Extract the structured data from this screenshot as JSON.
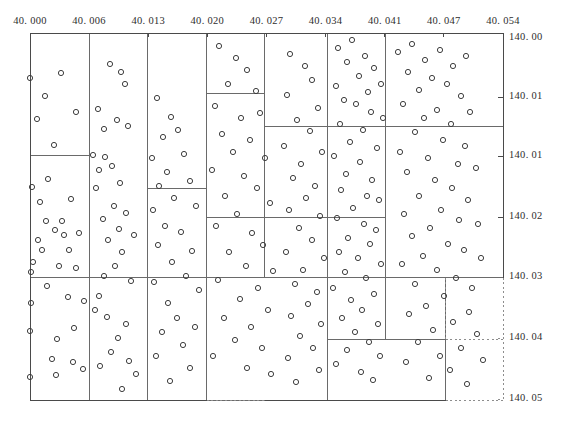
{
  "chart_data": {
    "type": "scatter",
    "title": "",
    "subtitle": "",
    "xlabel": "",
    "ylabel": "",
    "grid": false,
    "legend_position": "none",
    "xlim": [
      40.0,
      40.054
    ],
    "ylim": [
      140.0,
      140.05
    ],
    "y_axis_side": "right",
    "y_axis_direction": "inverted",
    "x_tick_labels": [
      "40. 000",
      "40. 006",
      "40. 013",
      "40. 020",
      "40. 027",
      "40. 034",
      "40. 041",
      "40. 047",
      "40. 054"
    ],
    "x_tick_values": [
      40.0,
      40.006,
      40.013,
      40.02,
      40.027,
      40.034,
      40.041,
      40.047,
      40.054
    ],
    "y_tick_labels": [
      "140. 00",
      "140. 01",
      "140. 01",
      "140. 02",
      "140. 03",
      "140. 04",
      "140. 05"
    ],
    "y_tick_values": [
      140.0,
      140.01,
      140.015,
      140.02,
      140.03,
      140.04,
      140.05
    ],
    "point_marker": "open-circle",
    "point_radius_px": 2.6,
    "colors": {
      "point_stroke": "#3d3d3d",
      "frame": "#4a4a4a",
      "partition": "#6a6a6a",
      "dotted": "#8d8d8d",
      "text": "#2e2e2e",
      "background": "#ffffff"
    },
    "points": [
      [
        30,
        78
      ],
      [
        45,
        96
      ],
      [
        61,
        73
      ],
      [
        37,
        119
      ],
      [
        76,
        112
      ],
      [
        54,
        145
      ],
      [
        32,
        187
      ],
      [
        48,
        179
      ],
      [
        40,
        202
      ],
      [
        71,
        199
      ],
      [
        46,
        221
      ],
      [
        62,
        221
      ],
      [
        38,
        240
      ],
      [
        33,
        262
      ],
      [
        42,
        250
      ],
      [
        69,
        250
      ],
      [
        59,
        266
      ],
      [
        64,
        235
      ],
      [
        55,
        230
      ],
      [
        79,
        233
      ],
      [
        31,
        272
      ],
      [
        76,
        268
      ],
      [
        47,
        286
      ],
      [
        31,
        303
      ],
      [
        68,
        297
      ],
      [
        84,
        301
      ],
      [
        30,
        331
      ],
      [
        74,
        328
      ],
      [
        57,
        339
      ],
      [
        52,
        359
      ],
      [
        73,
        362
      ],
      [
        30,
        377
      ],
      [
        56,
        375
      ],
      [
        83,
        369
      ],
      [
        110,
        64
      ],
      [
        121,
        72
      ],
      [
        125,
        84
      ],
      [
        98,
        109
      ],
      [
        104,
        129
      ],
      [
        117,
        120
      ],
      [
        128,
        126
      ],
      [
        93,
        155
      ],
      [
        105,
        157
      ],
      [
        99,
        170
      ],
      [
        112,
        166
      ],
      [
        96,
        188
      ],
      [
        120,
        183
      ],
      [
        114,
        206
      ],
      [
        103,
        219
      ],
      [
        126,
        213
      ],
      [
        119,
        229
      ],
      [
        108,
        240
      ],
      [
        134,
        235
      ],
      [
        122,
        252
      ],
      [
        115,
        266
      ],
      [
        104,
        276
      ],
      [
        131,
        281
      ],
      [
        99,
        296
      ],
      [
        95,
        310
      ],
      [
        107,
        317
      ],
      [
        126,
        324
      ],
      [
        118,
        338
      ],
      [
        111,
        352
      ],
      [
        100,
        366
      ],
      [
        129,
        361
      ],
      [
        136,
        374
      ],
      [
        122,
        389
      ],
      [
        157,
        98
      ],
      [
        171,
        117
      ],
      [
        163,
        137
      ],
      [
        178,
        130
      ],
      [
        152,
        158
      ],
      [
        184,
        154
      ],
      [
        167,
        172
      ],
      [
        159,
        186
      ],
      [
        190,
        181
      ],
      [
        174,
        198
      ],
      [
        153,
        210
      ],
      [
        196,
        206
      ],
      [
        165,
        226
      ],
      [
        181,
        232
      ],
      [
        158,
        245
      ],
      [
        192,
        251
      ],
      [
        172,
        262
      ],
      [
        186,
        276
      ],
      [
        154,
        282
      ],
      [
        199,
        290
      ],
      [
        168,
        303
      ],
      [
        177,
        318
      ],
      [
        162,
        332
      ],
      [
        195,
        327
      ],
      [
        183,
        345
      ],
      [
        156,
        356
      ],
      [
        190,
        368
      ],
      [
        170,
        381
      ],
      [
        219,
        46
      ],
      [
        236,
        58
      ],
      [
        247,
        70
      ],
      [
        228,
        84
      ],
      [
        256,
        91
      ],
      [
        215,
        106
      ],
      [
        241,
        118
      ],
      [
        260,
        113
      ],
      [
        222,
        134
      ],
      [
        250,
        140
      ],
      [
        233,
        152
      ],
      [
        265,
        158
      ],
      [
        212,
        170
      ],
      [
        244,
        176
      ],
      [
        257,
        188
      ],
      [
        225,
        196
      ],
      [
        270,
        203
      ],
      [
        237,
        214
      ],
      [
        216,
        226
      ],
      [
        252,
        233
      ],
      [
        263,
        245
      ],
      [
        229,
        252
      ],
      [
        246,
        266
      ],
      [
        273,
        271
      ],
      [
        218,
        280
      ],
      [
        258,
        288
      ],
      [
        240,
        299
      ],
      [
        268,
        310
      ],
      [
        224,
        318
      ],
      [
        251,
        327
      ],
      [
        235,
        340
      ],
      [
        262,
        348
      ],
      [
        213,
        356
      ],
      [
        247,
        368
      ],
      [
        271,
        374
      ],
      [
        290,
        54
      ],
      [
        305,
        66
      ],
      [
        312,
        80
      ],
      [
        287,
        95
      ],
      [
        318,
        108
      ],
      [
        297,
        120
      ],
      [
        310,
        131
      ],
      [
        284,
        146
      ],
      [
        322,
        152
      ],
      [
        301,
        164
      ],
      [
        293,
        178
      ],
      [
        315,
        186
      ],
      [
        306,
        198
      ],
      [
        289,
        210
      ],
      [
        320,
        216
      ],
      [
        299,
        228
      ],
      [
        312,
        240
      ],
      [
        286,
        252
      ],
      [
        324,
        258
      ],
      [
        303,
        270
      ],
      [
        295,
        284
      ],
      [
        317,
        292
      ],
      [
        308,
        304
      ],
      [
        291,
        316
      ],
      [
        321,
        324
      ],
      [
        300,
        336
      ],
      [
        313,
        348
      ],
      [
        288,
        358
      ],
      [
        319,
        370
      ],
      [
        296,
        382
      ],
      [
        338,
        48
      ],
      [
        352,
        40
      ],
      [
        365,
        56
      ],
      [
        347,
        62
      ],
      [
        374,
        68
      ],
      [
        359,
        76
      ],
      [
        336,
        86
      ],
      [
        368,
        92
      ],
      [
        381,
        84
      ],
      [
        344,
        100
      ],
      [
        356,
        104
      ],
      [
        371,
        112
      ],
      [
        383,
        118
      ],
      [
        340,
        124
      ],
      [
        363,
        130
      ],
      [
        350,
        142
      ],
      [
        377,
        148
      ],
      [
        334,
        156
      ],
      [
        360,
        162
      ],
      [
        346,
        174
      ],
      [
        372,
        180
      ],
      [
        341,
        190
      ],
      [
        367,
        196
      ],
      [
        379,
        200
      ],
      [
        353,
        208
      ],
      [
        337,
        218
      ],
      [
        364,
        224
      ],
      [
        376,
        230
      ],
      [
        348,
        238
      ],
      [
        370,
        244
      ],
      [
        339,
        252
      ],
      [
        358,
        258
      ],
      [
        381,
        264
      ],
      [
        345,
        272
      ],
      [
        366,
        278
      ],
      [
        333,
        288
      ],
      [
        374,
        294
      ],
      [
        351,
        300
      ],
      [
        362,
        310
      ],
      [
        342,
        318
      ],
      [
        378,
        324
      ],
      [
        355,
        332
      ],
      [
        369,
        342
      ],
      [
        347,
        350
      ],
      [
        380,
        356
      ],
      [
        336,
        364
      ],
      [
        361,
        372
      ],
      [
        373,
        380
      ],
      [
        398,
        52
      ],
      [
        412,
        44
      ],
      [
        425,
        60
      ],
      [
        440,
        50
      ],
      [
        453,
        66
      ],
      [
        466,
        56
      ],
      [
        408,
        72
      ],
      [
        432,
        78
      ],
      [
        447,
        84
      ],
      [
        419,
        90
      ],
      [
        461,
        96
      ],
      [
        403,
        104
      ],
      [
        437,
        110
      ],
      [
        424,
        118
      ],
      [
        470,
        112
      ],
      [
        451,
        124
      ],
      [
        415,
        132
      ],
      [
        443,
        140
      ],
      [
        465,
        146
      ],
      [
        400,
        152
      ],
      [
        428,
        158
      ],
      [
        458,
        164
      ],
      [
        407,
        172
      ],
      [
        476,
        168
      ],
      [
        435,
        180
      ],
      [
        452,
        188
      ],
      [
        419,
        196
      ],
      [
        468,
        200
      ],
      [
        441,
        210
      ],
      [
        404,
        214
      ],
      [
        459,
        220
      ],
      [
        430,
        228
      ],
      [
        478,
        224
      ],
      [
        412,
        236
      ],
      [
        448,
        244
      ],
      [
        464,
        250
      ],
      [
        423,
        256
      ],
      [
        402,
        264
      ],
      [
        481,
        258
      ],
      [
        437,
        270
      ],
      [
        456,
        278
      ],
      [
        415,
        284
      ],
      [
        472,
        288
      ],
      [
        444,
        296
      ],
      [
        426,
        306
      ],
      [
        409,
        314
      ],
      [
        469,
        312
      ],
      [
        453,
        322
      ],
      [
        433,
        330
      ],
      [
        477,
        334
      ],
      [
        418,
        342
      ],
      [
        461,
        348
      ],
      [
        440,
        356
      ],
      [
        406,
        362
      ],
      [
        483,
        360
      ],
      [
        450,
        370
      ],
      [
        429,
        378
      ],
      [
        467,
        384
      ]
    ],
    "partition_rects": [
      {
        "x": 30,
        "y": 33,
        "w": 473,
        "h": 244,
        "style": "solid"
      },
      {
        "x": 30,
        "y": 33,
        "w": 59,
        "h": 122,
        "style": "solid"
      },
      {
        "x": 89,
        "y": 33,
        "w": 58,
        "h": 244,
        "style": "solid"
      },
      {
        "x": 147,
        "y": 33,
        "w": 59,
        "h": 155,
        "style": "solid"
      },
      {
        "x": 206,
        "y": 33,
        "w": 58,
        "h": 60,
        "style": "solid"
      },
      {
        "x": 264,
        "y": 33,
        "w": 63,
        "h": 93,
        "style": "solid"
      },
      {
        "x": 327,
        "y": 33,
        "w": 58,
        "h": 93,
        "style": "solid"
      },
      {
        "x": 385,
        "y": 33,
        "w": 118,
        "h": 93,
        "style": "solid"
      },
      {
        "x": 30,
        "y": 155,
        "w": 59,
        "h": 122,
        "style": "solid"
      },
      {
        "x": 206,
        "y": 93,
        "w": 58,
        "h": 124,
        "style": "solid"
      },
      {
        "x": 264,
        "y": 126,
        "w": 63,
        "h": 91,
        "style": "solid"
      },
      {
        "x": 327,
        "y": 126,
        "w": 58,
        "h": 91,
        "style": "solid"
      },
      {
        "x": 385,
        "y": 126,
        "w": 118,
        "h": 151,
        "style": "solid"
      },
      {
        "x": 147,
        "y": 188,
        "w": 59,
        "h": 89,
        "style": "solid"
      },
      {
        "x": 206,
        "y": 217,
        "w": 58,
        "h": 60,
        "style": "solid"
      },
      {
        "x": 264,
        "y": 217,
        "w": 63,
        "h": 60,
        "style": "solid"
      },
      {
        "x": 30,
        "y": 277,
        "w": 59,
        "h": 123,
        "style": "mixed"
      },
      {
        "x": 89,
        "y": 277,
        "w": 58,
        "h": 123,
        "style": "mixed"
      },
      {
        "x": 147,
        "y": 277,
        "w": 59,
        "h": 123,
        "style": "solid"
      },
      {
        "x": 206,
        "y": 277,
        "w": 121,
        "h": 123,
        "style": "solid"
      },
      {
        "x": 327,
        "y": 277,
        "w": 58,
        "h": 62,
        "style": "solid"
      },
      {
        "x": 385,
        "y": 277,
        "w": 60,
        "h": 62,
        "style": "solid"
      },
      {
        "x": 327,
        "y": 339,
        "w": 118,
        "h": 61,
        "style": "solid"
      },
      {
        "x": 445,
        "y": 277,
        "w": 58,
        "h": 62,
        "style": "dashed-partial"
      }
    ]
  },
  "axes": {
    "x_axis_position": "top",
    "y_axis_position": "right"
  }
}
